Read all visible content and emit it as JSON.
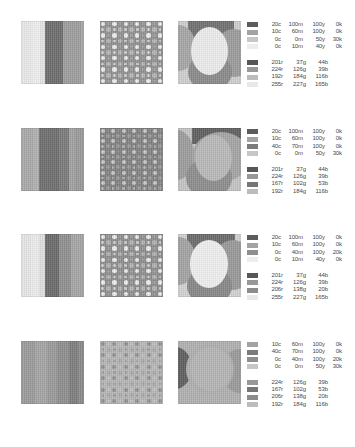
{
  "document": {
    "title": "Color Separation Reference Sheet",
    "background": "#ffffff",
    "rows": 4,
    "panels_per_row": 3
  },
  "labels": {
    "cyan_suffix": "c",
    "magenta_suffix": "m",
    "yellow_suffix": "y",
    "black_suffix": "k",
    "red_suffix": "r",
    "green_suffix": "g",
    "blue_suffix": "b"
  },
  "rows": [
    {
      "id": "row-1",
      "panels": [
        {
          "type": "stripes",
          "name": "vertical-stripe-panel",
          "background": "#d8d8d8",
          "stripes": [
            {
              "left": 0,
              "width": 11,
              "color": "#e9e9e9"
            },
            {
              "left": 11,
              "width": 8,
              "color": "#efefef"
            },
            {
              "left": 19,
              "width": 5,
              "color": "#e4e4e4"
            },
            {
              "left": 24,
              "width": 18,
              "color": "#6d6d6d"
            },
            {
              "left": 42,
              "width": 18,
              "color": "#9d9d9d"
            },
            {
              "left": 60,
              "width": 3,
              "color": "#a8a8a8"
            }
          ]
        },
        {
          "type": "halftone-dots",
          "name": "halftone-dot-panel",
          "background": "#8f8f8f",
          "dot_colors": [
            "#eeeeee",
            "#b5b5b5",
            "#cfcfcf",
            "#a0a0a0"
          ],
          "cols": 11,
          "rows": 11,
          "dot_size": 4.4
        },
        {
          "type": "shapes",
          "name": "organic-shapes-panel",
          "background": "#cfcfcf",
          "shapes": [
            {
              "kind": "rect",
              "x": 10,
              "y": 0,
              "w": 46,
              "h": 20,
              "color": "#707070"
            },
            {
              "kind": "ellipse",
              "x": -16,
              "y": 4,
              "w": 34,
              "h": 46,
              "color": "#a6a6a6"
            },
            {
              "kind": "ellipse",
              "x": 36,
              "y": 8,
              "w": 40,
              "h": 48,
              "color": "#9c9c9c"
            },
            {
              "kind": "ellipse",
              "x": 10,
              "y": 32,
              "w": 44,
              "h": 38,
              "color": "#8a8a8a"
            },
            {
              "kind": "ellipse",
              "x": 13,
              "y": 6,
              "w": 37,
              "h": 48,
              "color": "#ececec"
            }
          ]
        }
      ],
      "cmyk": {
        "name": "cmyk-legend",
        "entries": [
          {
            "swatch": "#5c5c5c",
            "c": "20c",
            "m": "100m",
            "y": "100y",
            "k": "0k"
          },
          {
            "swatch": "#a3a3a3",
            "c": "10c",
            "m": "60m",
            "y": "100y",
            "k": "0k"
          },
          {
            "swatch": "#c6c6c6",
            "c": "0c",
            "m": "0m",
            "y": "50y",
            "k": "30k"
          },
          {
            "swatch": "#ededed",
            "c": "0c",
            "m": "10m",
            "y": "40y",
            "k": "0k"
          }
        ]
      },
      "rgb": {
        "name": "rgb-legend",
        "entries": [
          {
            "swatch": "#575757",
            "r": "201r",
            "g": "37g",
            "b": "44b"
          },
          {
            "swatch": "#989898",
            "r": "224r",
            "g": "126g",
            "b": "39b"
          },
          {
            "swatch": "#bcbcbc",
            "r": "192r",
            "g": "184g",
            "b": "116b"
          },
          {
            "swatch": "#e8e8e8",
            "r": "255r",
            "g": "227g",
            "b": "165b"
          }
        ]
      }
    },
    {
      "id": "row-2",
      "panels": [
        {
          "type": "stripes",
          "name": "vertical-stripe-panel",
          "background": "#b4b4b4",
          "stripes": [
            {
              "left": 0,
              "width": 12,
              "color": "#a9a9a9"
            },
            {
              "left": 12,
              "width": 6,
              "color": "#b0b0b0"
            },
            {
              "left": 18,
              "width": 20,
              "color": "#6e6e6e"
            },
            {
              "left": 38,
              "width": 10,
              "color": "#7a7a7a"
            },
            {
              "left": 48,
              "width": 6,
              "color": "#a2a2a2"
            },
            {
              "left": 54,
              "width": 9,
              "color": "#9a9a9a"
            }
          ]
        },
        {
          "type": "halftone-dots",
          "name": "halftone-dot-panel",
          "background": "#7e7e7e",
          "dot_colors": [
            "#c9c9c9",
            "#9a9a9a",
            "#b0b0b0",
            "#8b8b8b"
          ],
          "cols": 12,
          "rows": 12,
          "dot_size": 4.0
        },
        {
          "type": "shapes",
          "name": "organic-shapes-panel",
          "background": "#c4c4c4",
          "shapes": [
            {
              "kind": "rect",
              "x": 14,
              "y": 0,
              "w": 49,
              "h": 16,
              "color": "#5f5f5f"
            },
            {
              "kind": "ellipse",
              "x": -18,
              "y": 2,
              "w": 34,
              "h": 50,
              "color": "#9c9c9c"
            },
            {
              "kind": "ellipse",
              "x": 14,
              "y": 4,
              "w": 58,
              "h": 50,
              "color": "#a4a4a4"
            },
            {
              "kind": "ellipse",
              "x": 8,
              "y": 30,
              "w": 46,
              "h": 40,
              "color": "#8d8d8d"
            },
            {
              "kind": "ellipse",
              "x": 17,
              "y": 7,
              "w": 37,
              "h": 46,
              "color": "#b9b9b9"
            }
          ]
        }
      ],
      "cmyk": {
        "name": "cmyk-legend",
        "entries": [
          {
            "swatch": "#5c5c5c",
            "c": "20c",
            "m": "100m",
            "y": "100y",
            "k": "0k"
          },
          {
            "swatch": "#a3a3a3",
            "c": "10c",
            "m": "60m",
            "y": "100y",
            "k": "0k"
          },
          {
            "swatch": "#7b7b7b",
            "c": "40c",
            "m": "70m",
            "y": "100y",
            "k": "0k"
          },
          {
            "swatch": "#c6c6c6",
            "c": "0c",
            "m": "0m",
            "y": "50y",
            "k": "30k"
          }
        ]
      },
      "rgb": {
        "name": "rgb-legend",
        "entries": [
          {
            "swatch": "#575757",
            "r": "201r",
            "g": "37g",
            "b": "44b"
          },
          {
            "swatch": "#989898",
            "r": "224r",
            "g": "126g",
            "b": "39b"
          },
          {
            "swatch": "#767676",
            "r": "167r",
            "g": "102g",
            "b": "53b"
          },
          {
            "swatch": "#bcbcbc",
            "r": "192r",
            "g": "184g",
            "b": "116b"
          }
        ]
      }
    },
    {
      "id": "row-3",
      "panels": [
        {
          "type": "stripes",
          "name": "vertical-stripe-panel",
          "background": "#d9d9d9",
          "stripes": [
            {
              "left": 0,
              "width": 10,
              "color": "#e6e6e6"
            },
            {
              "left": 10,
              "width": 8,
              "color": "#ececec"
            },
            {
              "left": 18,
              "width": 6,
              "color": "#e0e0e0"
            },
            {
              "left": 24,
              "width": 14,
              "color": "#6a6a6a"
            },
            {
              "left": 38,
              "width": 12,
              "color": "#8f8f8f"
            },
            {
              "left": 50,
              "width": 13,
              "color": "#a5a5a5"
            }
          ]
        },
        {
          "type": "halftone-dots",
          "name": "halftone-dot-panel",
          "background": "#8c8c8c",
          "dot_colors": [
            "#ededed",
            "#b2b2b2",
            "#cccccc",
            "#9d9d9d"
          ],
          "cols": 11,
          "rows": 11,
          "dot_size": 4.4
        },
        {
          "type": "shapes",
          "name": "organic-shapes-panel",
          "background": "#d2d2d2",
          "shapes": [
            {
              "kind": "rect",
              "x": 9,
              "y": 0,
              "w": 48,
              "h": 19,
              "color": "#6b6b6b"
            },
            {
              "kind": "ellipse",
              "x": -16,
              "y": 3,
              "w": 34,
              "h": 48,
              "color": "#a3a3a3"
            },
            {
              "kind": "ellipse",
              "x": 34,
              "y": 6,
              "w": 42,
              "h": 50,
              "color": "#999999"
            },
            {
              "kind": "ellipse",
              "x": 9,
              "y": 33,
              "w": 45,
              "h": 38,
              "color": "#878787"
            },
            {
              "kind": "ellipse",
              "x": 12,
              "y": 6,
              "w": 38,
              "h": 48,
              "color": "#efefef"
            }
          ]
        }
      ],
      "cmyk": {
        "name": "cmyk-legend",
        "entries": [
          {
            "swatch": "#5c5c5c",
            "c": "20c",
            "m": "100m",
            "y": "100y",
            "k": "0k"
          },
          {
            "swatch": "#a3a3a3",
            "c": "10c",
            "m": "60m",
            "y": "100y",
            "k": "0k"
          },
          {
            "swatch": "#8e8e8e",
            "c": "0c",
            "m": "40m",
            "y": "100y",
            "k": "20k"
          },
          {
            "swatch": "#ededed",
            "c": "0c",
            "m": "10m",
            "y": "40y",
            "k": "0k"
          }
        ]
      },
      "rgb": {
        "name": "rgb-legend",
        "entries": [
          {
            "swatch": "#575757",
            "r": "201r",
            "g": "37g",
            "b": "44b"
          },
          {
            "swatch": "#989898",
            "r": "224r",
            "g": "126g",
            "b": "39b"
          },
          {
            "swatch": "#8c8c8c",
            "r": "206r",
            "g": "138g",
            "b": "20b"
          },
          {
            "swatch": "#e8e8e8",
            "r": "255r",
            "g": "227g",
            "b": "165b"
          }
        ]
      }
    },
    {
      "id": "row-4",
      "panels": [
        {
          "type": "stripes",
          "name": "vertical-stripe-panel",
          "background": "#9f9f9f",
          "stripes": [
            {
              "left": 0,
              "width": 14,
              "color": "#9b9b9b"
            },
            {
              "left": 14,
              "width": 12,
              "color": "#a4a4a4"
            },
            {
              "left": 26,
              "width": 10,
              "color": "#9a9a9a"
            },
            {
              "left": 36,
              "width": 12,
              "color": "#8e8e8e"
            },
            {
              "left": 48,
              "width": 9,
              "color": "#7d7d7d"
            },
            {
              "left": 57,
              "width": 6,
              "color": "#8a8a8a"
            }
          ]
        },
        {
          "type": "halftone-dots",
          "name": "halftone-dot-panel",
          "background": "#b6b6b6",
          "dot_colors": [
            "#8f8f8f",
            "#a8a8a8",
            "#9b9b9b",
            "#c2c2c2"
          ],
          "cols": 11,
          "rows": 11,
          "dot_size": 4.0
        },
        {
          "type": "shapes",
          "name": "organic-shapes-panel",
          "background": "#b9b9b9",
          "shapes": [
            {
              "kind": "rect",
              "x": 0,
              "y": 0,
              "w": 63,
              "h": 63,
              "color": "#b0b0b0"
            },
            {
              "kind": "ellipse",
              "x": -20,
              "y": 6,
              "w": 34,
              "h": 42,
              "color": "#5e5e5e"
            },
            {
              "kind": "ellipse",
              "x": 44,
              "y": 8,
              "w": 34,
              "h": 44,
              "color": "#9a9a9a"
            },
            {
              "kind": "ellipse",
              "x": 8,
              "y": 3,
              "w": 48,
              "h": 50,
              "color": "#aeaeae"
            },
            {
              "kind": "ellipse",
              "x": 12,
              "y": 6,
              "w": 42,
              "h": 44,
              "color": "#b4b4b4"
            }
          ]
        }
      ],
      "cmyk": {
        "name": "cmyk-legend",
        "entries": [
          {
            "swatch": "#a3a3a3",
            "c": "10c",
            "m": "60m",
            "y": "100y",
            "k": "0k"
          },
          {
            "swatch": "#7b7b7b",
            "c": "40c",
            "m": "70m",
            "y": "100y",
            "k": "0k"
          },
          {
            "swatch": "#8e8e8e",
            "c": "0c",
            "m": "40m",
            "y": "100y",
            "k": "20k"
          },
          {
            "swatch": "#c6c6c6",
            "c": "0c",
            "m": "0m",
            "y": "50y",
            "k": "30k"
          }
        ]
      },
      "rgb": {
        "name": "rgb-legend",
        "entries": [
          {
            "swatch": "#989898",
            "r": "224r",
            "g": "126g",
            "b": "39b"
          },
          {
            "swatch": "#767676",
            "r": "167r",
            "g": "102g",
            "b": "53b"
          },
          {
            "swatch": "#8c8c8c",
            "r": "206r",
            "g": "138g",
            "b": "20b"
          },
          {
            "swatch": "#bcbcbc",
            "r": "192r",
            "g": "184g",
            "b": "116b"
          }
        ]
      }
    }
  ]
}
